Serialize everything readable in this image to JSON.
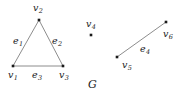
{
  "figure": {
    "caption": "G",
    "width": 182,
    "height": 97,
    "background": "#ffffff",
    "stroke_color": "#808080",
    "vertex_color": "#1a1a1a",
    "text_color": "#1a1a1a"
  },
  "chart_data": {
    "type": "diagram",
    "title": "G",
    "vertices": [
      {
        "id": "v1",
        "label": "v",
        "sub": "1",
        "x": 13,
        "y": 66,
        "label_x": 8,
        "label_y": 70
      },
      {
        "id": "v2",
        "label": "v",
        "sub": "2",
        "x": 39,
        "y": 20,
        "label_x": 33,
        "label_y": 3
      },
      {
        "id": "v3",
        "label": "v",
        "sub": "3",
        "x": 63,
        "y": 66,
        "label_x": 59,
        "label_y": 70
      },
      {
        "id": "v4",
        "label": "v",
        "sub": "4",
        "x": 91,
        "y": 35,
        "label_x": 86,
        "label_y": 19
      },
      {
        "id": "v5",
        "label": "v",
        "sub": "5",
        "x": 117,
        "y": 57,
        "label_x": 122,
        "label_y": 60
      },
      {
        "id": "v6",
        "label": "v",
        "sub": "6",
        "x": 166,
        "y": 22,
        "label_x": 163,
        "label_y": 29
      }
    ],
    "edges": [
      {
        "id": "e1",
        "label": "e",
        "sub": "1",
        "from": "v1",
        "to": "v2",
        "label_x": 13,
        "label_y": 36
      },
      {
        "id": "e2",
        "label": "e",
        "sub": "2",
        "from": "v2",
        "to": "v3",
        "label_x": 52,
        "label_y": 36
      },
      {
        "id": "e3",
        "label": "e",
        "sub": "3",
        "from": "v1",
        "to": "v3",
        "label_x": 32,
        "label_y": 70
      },
      {
        "id": "e4",
        "label": "e",
        "sub": "4",
        "from": "v5",
        "to": "v6",
        "label_x": 140,
        "label_y": 44
      }
    ],
    "isolated_vertices": [
      "v4"
    ]
  }
}
